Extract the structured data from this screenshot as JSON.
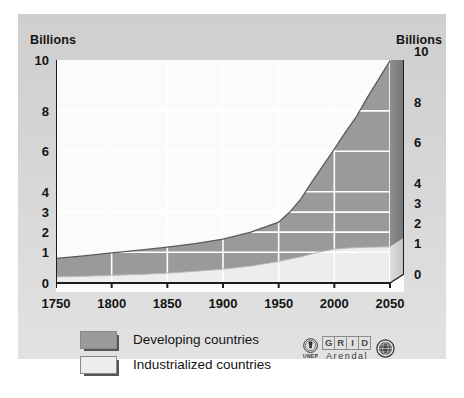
{
  "axes": {
    "left_caption": "Billions",
    "right_caption": "Billions"
  },
  "legend": {
    "items": [
      {
        "label": "Developing countries",
        "color": "#9a9a9a",
        "key": "developing"
      },
      {
        "label": "Industrialized countries",
        "color": "#ededed",
        "key": "industrialized"
      }
    ]
  },
  "logo": {
    "unep_text": "UNEP",
    "grid_letters": [
      "G",
      "R",
      "I",
      "D"
    ],
    "arendal_text": "Arendal",
    "un_emblem": "un-globe-icon"
  },
  "chart_data": {
    "type": "area",
    "stacked": true,
    "title": "",
    "xlabel": "",
    "ylabel": "Billions",
    "xlim": [
      1750,
      2050
    ],
    "ylim": [
      0,
      10
    ],
    "grid": true,
    "legend_position": "bottom-left",
    "xticks": [
      1750,
      1800,
      1850,
      1900,
      1950,
      2000,
      2050
    ],
    "yticks": [
      0,
      1,
      2,
      3,
      4,
      6,
      8,
      10
    ],
    "ytick_fractions": [
      0,
      0.138,
      0.228,
      0.318,
      0.409,
      0.591,
      0.772,
      1.0
    ],
    "x": [
      1750,
      1775,
      1800,
      1825,
      1850,
      1875,
      1900,
      1925,
      1950,
      1960,
      1970,
      1980,
      1990,
      2000,
      2010,
      2020,
      2030,
      2040,
      2050
    ],
    "series": [
      {
        "name": "Industrialized countries",
        "color": "#ededed",
        "values": [
          0.2,
          0.22,
          0.25,
          0.28,
          0.32,
          0.38,
          0.45,
          0.55,
          0.7,
          0.78,
          0.85,
          0.95,
          1.05,
          1.15,
          1.2,
          1.23,
          1.25,
          1.26,
          1.27
        ]
      },
      {
        "name": "Developing countries",
        "color": "#9a9a9a",
        "values": [
          0.6,
          0.66,
          0.73,
          0.82,
          0.93,
          1.05,
          1.2,
          1.45,
          1.8,
          2.2,
          2.8,
          3.55,
          4.25,
          4.95,
          5.75,
          6.5,
          7.3,
          8.0,
          8.7
        ]
      }
    ],
    "totals": [
      0.8,
      0.88,
      0.98,
      1.1,
      1.25,
      1.43,
      1.65,
      2.0,
      2.5,
      3.0,
      3.65,
      4.5,
      5.3,
      6.1,
      6.95,
      7.73,
      8.55,
      9.26,
      9.97
    ]
  }
}
